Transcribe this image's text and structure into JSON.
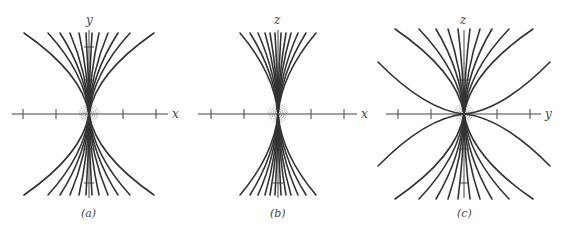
{
  "figure": {
    "panels": [
      {
        "id": "a",
        "caption": "(a)",
        "horizontal_axis_label": "x",
        "vertical_axis_label": "y",
        "center": [
          89,
          114
        ],
        "h_axis_range": [
          12,
          168
        ],
        "v_axis_range": [
          30,
          198
        ],
        "h_ticks": [
          23,
          56,
          123,
          156
        ],
        "v_ticks": [
          47,
          80,
          149,
          183
        ],
        "top_offsets": [
          -65,
          -41,
          -29,
          -19,
          -10,
          -3,
          3,
          10,
          19,
          29,
          41,
          65
        ],
        "curve_extent_y": 81,
        "side_curves": []
      },
      {
        "id": "b",
        "caption": "(b)",
        "horizontal_axis_label": "x",
        "vertical_axis_label": "z",
        "center": [
          278,
          114
        ],
        "h_axis_range": [
          198,
          357
        ],
        "v_axis_range": [
          30,
          198
        ],
        "h_ticks": [
          211,
          244,
          311,
          344
        ],
        "v_ticks": [
          80,
          149,
          183
        ],
        "top_offsets": [
          -38,
          -28,
          -20,
          -13,
          -8,
          -3,
          3,
          8,
          13,
          20,
          28,
          38
        ],
        "curve_extent_y": 81,
        "side_curves": []
      },
      {
        "id": "c",
        "caption": "(c)",
        "horizontal_axis_label": "y",
        "vertical_axis_label": "z",
        "center": [
          464,
          114
        ],
        "h_axis_range": [
          386,
          541
        ],
        "v_axis_range": [
          30,
          198
        ],
        "h_ticks": [
          398,
          431,
          497,
          530
        ],
        "v_ticks": [
          80,
          149,
          183
        ],
        "top_offsets": [
          -69,
          -45,
          -28,
          -16,
          -6,
          6,
          16,
          28,
          45,
          69
        ],
        "curve_extent_y": 85,
        "side_curves": [
          {
            "dx": 86,
            "dy": 52
          }
        ]
      }
    ]
  }
}
